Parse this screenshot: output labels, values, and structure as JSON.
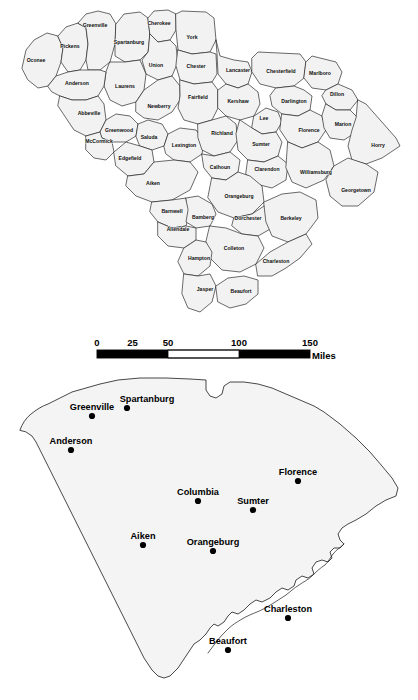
{
  "page": {
    "background_color": "#ffffff",
    "width": 418,
    "height": 700
  },
  "county_map": {
    "name": "South Carolina county map",
    "fill_color": "#f2f2f2",
    "stroke_color": "#1a1a1a",
    "county_count": 46,
    "counties": [
      {
        "name": "Oconee",
        "label_x": 36,
        "label_y": 61
      },
      {
        "name": "Pickens",
        "label_x": 70,
        "label_y": 47
      },
      {
        "name": "Greenville",
        "label_x": 95,
        "label_y": 26
      },
      {
        "name": "Spartanburg",
        "label_x": 129,
        "label_y": 43
      },
      {
        "name": "Cherokee",
        "label_x": 159,
        "label_y": 24
      },
      {
        "name": "York",
        "label_x": 192,
        "label_y": 38
      },
      {
        "name": "Chester",
        "label_x": 196,
        "label_y": 67
      },
      {
        "name": "Union",
        "label_x": 156,
        "label_y": 66
      },
      {
        "name": "Laurens",
        "label_x": 125,
        "label_y": 87
      },
      {
        "name": "Anderson",
        "label_x": 77,
        "label_y": 84
      },
      {
        "name": "Abbeville",
        "label_x": 89,
        "label_y": 114
      },
      {
        "name": "Newberry",
        "label_x": 159,
        "label_y": 107
      },
      {
        "name": "Fairfield",
        "label_x": 198,
        "label_y": 98
      },
      {
        "name": "Lancaster",
        "label_x": 238,
        "label_y": 71
      },
      {
        "name": "Chesterfield",
        "label_x": 281,
        "label_y": 72
      },
      {
        "name": "Marlboro",
        "label_x": 320,
        "label_y": 74
      },
      {
        "name": "Kershaw",
        "label_x": 238,
        "label_y": 102
      },
      {
        "name": "Darlington",
        "label_x": 294,
        "label_y": 102
      },
      {
        "name": "Dillon",
        "label_x": 337,
        "label_y": 95
      },
      {
        "name": "Greenwood",
        "label_x": 119,
        "label_y": 131
      },
      {
        "name": "McCormick",
        "label_x": 99,
        "label_y": 142
      },
      {
        "name": "Saluda",
        "label_x": 149,
        "label_y": 138
      },
      {
        "name": "Edgefield",
        "label_x": 130,
        "label_y": 159
      },
      {
        "name": "Lexington",
        "label_x": 184,
        "label_y": 146
      },
      {
        "name": "Richland",
        "label_x": 222,
        "label_y": 134
      },
      {
        "name": "Lee",
        "label_x": 264,
        "label_y": 119
      },
      {
        "name": "Sumter",
        "label_x": 261,
        "label_y": 145
      },
      {
        "name": "Florence",
        "label_x": 309,
        "label_y": 131
      },
      {
        "name": "Marion",
        "label_x": 343,
        "label_y": 125
      },
      {
        "name": "Horry",
        "label_x": 378,
        "label_y": 146
      },
      {
        "name": "Calhoun",
        "label_x": 220,
        "label_y": 168
      },
      {
        "name": "Clarendon",
        "label_x": 267,
        "label_y": 170
      },
      {
        "name": "Williamsburg",
        "label_x": 316,
        "label_y": 173
      },
      {
        "name": "Georgetown",
        "label_x": 356,
        "label_y": 191
      },
      {
        "name": "Aiken",
        "label_x": 153,
        "label_y": 184
      },
      {
        "name": "Orangeburg",
        "label_x": 239,
        "label_y": 197
      },
      {
        "name": "Barnwell",
        "label_x": 172,
        "label_y": 212
      },
      {
        "name": "Bamberg",
        "label_x": 203,
        "label_y": 218
      },
      {
        "name": "Dorchester",
        "label_x": 248,
        "label_y": 219
      },
      {
        "name": "Berkeley",
        "label_x": 291,
        "label_y": 219
      },
      {
        "name": "Allendale",
        "label_x": 178,
        "label_y": 230
      },
      {
        "name": "Colleton",
        "label_x": 234,
        "label_y": 249
      },
      {
        "name": "Hampton",
        "label_x": 199,
        "label_y": 259
      },
      {
        "name": "Charleston",
        "label_x": 276,
        "label_y": 262
      },
      {
        "name": "Jasper",
        "label_x": 205,
        "label_y": 290
      },
      {
        "name": "Beaufort",
        "label_x": 241,
        "label_y": 292
      }
    ]
  },
  "scale_bar": {
    "name": "distance scale bar",
    "unit_label": "Miles",
    "ticks": [
      "0",
      "25",
      "50",
      "100",
      "150"
    ],
    "tick_values": [
      0,
      25,
      50,
      100,
      150
    ],
    "segments": [
      {
        "from": 0,
        "to": 50,
        "filled": true
      },
      {
        "from": 50,
        "to": 100,
        "filled": false
      },
      {
        "from": 100,
        "to": 150,
        "filled": true
      }
    ],
    "bar_left_px": 97,
    "bar_right_px": 310,
    "bar_top_px": 350,
    "bar_height_px": 8
  },
  "city_map": {
    "name": "South Carolina principal cities map",
    "fill_color": "#f4f4f4",
    "stroke_color": "#1a1a1a",
    "city_count": 9,
    "cities": [
      {
        "name": "Greenville",
        "dot_x": 92,
        "dot_y": 416,
        "label_x": 92,
        "label_y": 410
      },
      {
        "name": "Spartanburg",
        "dot_x": 127,
        "dot_y": 408,
        "label_x": 147,
        "label_y": 402
      },
      {
        "name": "Anderson",
        "dot_x": 71,
        "dot_y": 450,
        "label_x": 71,
        "label_y": 444
      },
      {
        "name": "Florence",
        "dot_x": 298,
        "dot_y": 481,
        "label_x": 298,
        "label_y": 475
      },
      {
        "name": "Columbia",
        "dot_x": 198,
        "dot_y": 501,
        "label_x": 198,
        "label_y": 495
      },
      {
        "name": "Sumter",
        "dot_x": 253,
        "dot_y": 510,
        "label_x": 253,
        "label_y": 504
      },
      {
        "name": "Aiken",
        "dot_x": 143,
        "dot_y": 545,
        "label_x": 143,
        "label_y": 539
      },
      {
        "name": "Orangeburg",
        "dot_x": 213,
        "dot_y": 551,
        "label_x": 213,
        "label_y": 545
      },
      {
        "name": "Charleston",
        "dot_x": 288,
        "dot_y": 618,
        "label_x": 288,
        "label_y": 612
      },
      {
        "name": "Beaufort",
        "dot_x": 228,
        "dot_y": 650,
        "label_x": 228,
        "label_y": 644
      }
    ]
  }
}
